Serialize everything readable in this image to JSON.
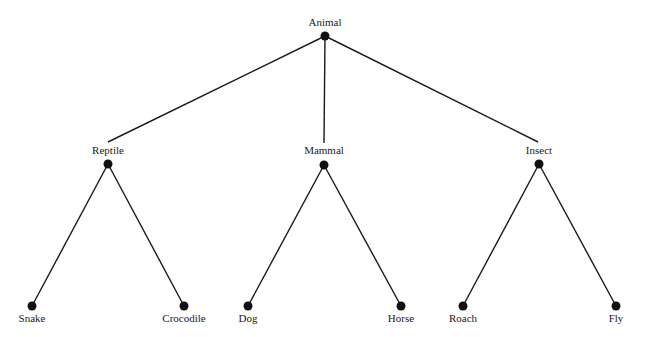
{
  "diagram": {
    "type": "tree",
    "colors": {
      "line": "#1a1a1a",
      "node": "#111111",
      "background": "#ffffff"
    },
    "root": {
      "id": "animal",
      "label": "Animal"
    },
    "nodes": [
      {
        "id": "animal",
        "label": "Animal",
        "x": 325,
        "y": 36,
        "label_y": 26
      },
      {
        "id": "reptile",
        "label": "Reptile",
        "x": 108,
        "y": 164,
        "label_y": 153
      },
      {
        "id": "mammal",
        "label": "Mammal",
        "x": 324,
        "y": 165,
        "label_y": 153
      },
      {
        "id": "insect",
        "label": "Insect",
        "x": 539,
        "y": 164,
        "label_y": 153
      },
      {
        "id": "snake",
        "label": "Snake",
        "x": 32,
        "y": 306,
        "label_y": 322
      },
      {
        "id": "crocodile",
        "label": "Crocodile",
        "x": 184,
        "y": 306,
        "label_y": 322
      },
      {
        "id": "dog",
        "label": "Dog",
        "x": 248,
        "y": 306,
        "label_y": 322
      },
      {
        "id": "horse",
        "label": "Horse",
        "x": 401,
        "y": 306,
        "label_y": 322
      },
      {
        "id": "roach",
        "label": "Roach",
        "x": 463,
        "y": 306,
        "label_y": 322
      },
      {
        "id": "fly",
        "label": "Fly",
        "x": 616,
        "y": 306,
        "label_y": 322
      }
    ],
    "edges": [
      {
        "from": "animal",
        "to": "reptile"
      },
      {
        "from": "animal",
        "to": "mammal"
      },
      {
        "from": "animal",
        "to": "insect"
      },
      {
        "from": "reptile",
        "to": "snake"
      },
      {
        "from": "reptile",
        "to": "crocodile"
      },
      {
        "from": "mammal",
        "to": "dog"
      },
      {
        "from": "mammal",
        "to": "horse"
      },
      {
        "from": "insect",
        "to": "roach"
      },
      {
        "from": "insect",
        "to": "fly"
      }
    ],
    "labels": {
      "animal": "Animal",
      "reptile": "Reptile",
      "mammal": "Mammal",
      "insect": "Insect",
      "snake": "Snake",
      "crocodile": "Crocodile",
      "dog": "Dog",
      "horse": "Horse",
      "roach": "Roach",
      "fly": "Fly"
    }
  }
}
